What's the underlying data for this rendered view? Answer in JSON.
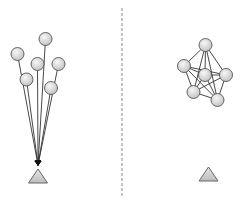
{
  "diagram": {
    "divider": {
      "x": 122,
      "y1": 8,
      "y2": 198,
      "color": "#888888"
    },
    "colors": {
      "node_fill_light": "#f4f4f4",
      "node_fill_dark": "#c8c8c8",
      "stroke": "#555555",
      "edge": "#333333"
    },
    "left_panel": {
      "nodes": [
        {
          "x": 45.5,
          "y": 39
        },
        {
          "x": 17.5,
          "y": 54
        },
        {
          "x": 37.5,
          "y": 64
        },
        {
          "x": 58.5,
          "y": 64
        },
        {
          "x": 26.5,
          "y": 79.5
        },
        {
          "x": 51,
          "y": 88
        }
      ],
      "target": {
        "x": 38,
        "apex_y": 169,
        "base_y": 183,
        "half_width": 9.5
      },
      "arrow_tip": {
        "x": 38,
        "y": 165
      }
    },
    "right_panel": {
      "nodes": [
        {
          "x": 205.5,
          "y": 45
        },
        {
          "x": 184,
          "y": 66
        },
        {
          "x": 205,
          "y": 75
        },
        {
          "x": 226,
          "y": 75
        },
        {
          "x": 193.5,
          "y": 92
        },
        {
          "x": 217.5,
          "y": 100
        }
      ],
      "edges": [
        [
          0,
          1
        ],
        [
          0,
          2
        ],
        [
          0,
          3
        ],
        [
          0,
          4
        ],
        [
          0,
          5
        ],
        [
          1,
          2
        ],
        [
          1,
          3
        ],
        [
          1,
          4
        ],
        [
          1,
          5
        ],
        [
          2,
          3
        ],
        [
          2,
          4
        ],
        [
          2,
          5
        ],
        [
          3,
          5
        ],
        [
          4,
          5
        ],
        [
          3,
          4
        ]
      ],
      "target": {
        "x": 208.5,
        "apex_y": 167,
        "base_y": 181,
        "half_width": 9.5
      }
    }
  }
}
